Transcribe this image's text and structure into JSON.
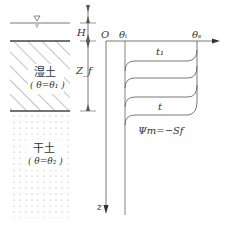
{
  "diagram": {
    "type": "soil infiltration moisture profile",
    "soil_column": {
      "water_surface_symbol": "▽",
      "wet_layer": {
        "name": "湿土",
        "condition": "( θ=θ₁ )",
        "pattern": "diagonal hatch"
      },
      "dry_layer": {
        "name": "干土",
        "condition": "( θ=θ₂ )",
        "pattern": "dots"
      }
    },
    "dimensions": {
      "ponding_depth": "H",
      "wetting_front_depth": "Z_f"
    },
    "axes": {
      "origin": "O",
      "x_axis_start_label": "θᵢ",
      "x_axis_end_label": "θₛ",
      "depth_axis_label": "z"
    },
    "curves": {
      "count": 4,
      "first_label": "t₁",
      "last_label": "t"
    },
    "annotation": "Ψm=−Sf"
  },
  "colors": {
    "line": "#555555",
    "text": "#333333",
    "background": "#ffffff"
  }
}
